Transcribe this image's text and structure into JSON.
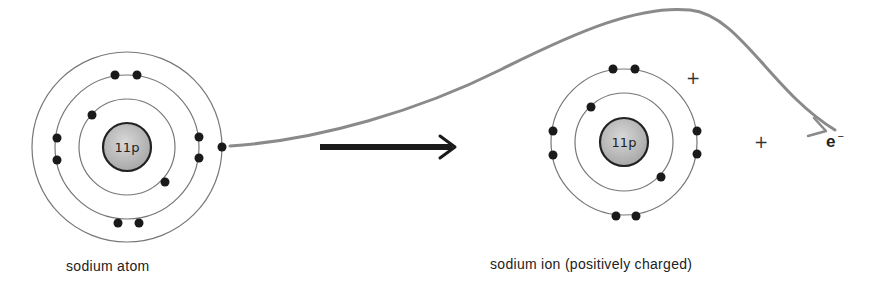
{
  "diagram": {
    "atom": {
      "label": "sodium atom",
      "nucleus_label": "11p",
      "shells": [
        2,
        8,
        1
      ]
    },
    "ion": {
      "label": "sodium ion (positively charged)",
      "nucleus_label": "11p",
      "shells": [
        2,
        8
      ],
      "charge_symbols": [
        "+",
        "+"
      ]
    },
    "electron": {
      "symbol": "e",
      "charge": "−"
    },
    "arrows": {
      "transition": "reaction-arrow",
      "electron_path": "curved-arrow"
    },
    "colors": {
      "line": "#555555",
      "electron": "#1a1a1a",
      "nucleus_fill": "#bdbdbd",
      "curve": "#8a8a8a"
    }
  }
}
